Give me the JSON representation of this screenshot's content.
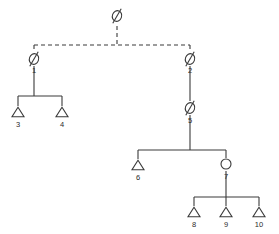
{
  "diagram": {
    "type": "pedigree-chart",
    "title": "",
    "background_color": "#ffffff",
    "line_color": "#3a3a3a",
    "label_color": "#2b2b2b",
    "symbol_legend": {
      "triangle": "unknown-sex individual",
      "circle": "female individual",
      "slashed-circle": "deceased or unspecified individual"
    },
    "nodes": [
      {
        "id": "n0",
        "label": "",
        "symbol": "slashed-circle",
        "x": 117,
        "y": 16,
        "label_x": 117,
        "label_y": 29
      },
      {
        "id": "n1",
        "label": "1",
        "symbol": "slashed-circle",
        "x": 34,
        "y": 59,
        "label_x": 34,
        "label_y": 71
      },
      {
        "id": "n2",
        "label": "2",
        "symbol": "slashed-circle",
        "x": 190,
        "y": 59,
        "label_x": 190,
        "label_y": 71
      },
      {
        "id": "n3",
        "label": "3",
        "symbol": "triangle",
        "x": 18,
        "y": 112,
        "label_x": 18,
        "label_y": 125
      },
      {
        "id": "n4",
        "label": "4",
        "symbol": "triangle",
        "x": 62,
        "y": 112,
        "label_x": 62,
        "label_y": 125
      },
      {
        "id": "n5",
        "label": "5",
        "symbol": "slashed-circle",
        "x": 190,
        "y": 108,
        "label_x": 190,
        "label_y": 121
      },
      {
        "id": "n6",
        "label": "6",
        "symbol": "triangle",
        "x": 138,
        "y": 165,
        "label_x": 138,
        "label_y": 178
      },
      {
        "id": "n7",
        "label": "7",
        "symbol": "circle",
        "x": 226,
        "y": 164,
        "label_x": 226,
        "label_y": 177
      },
      {
        "id": "n8",
        "label": "8",
        "symbol": "triangle",
        "x": 194,
        "y": 212,
        "label_x": 194,
        "label_y": 225
      },
      {
        "id": "n9",
        "label": "9",
        "symbol": "triangle",
        "x": 226,
        "y": 212,
        "label_x": 226,
        "label_y": 225
      },
      {
        "id": "n10",
        "label": "10",
        "symbol": "triangle",
        "x": 259,
        "y": 212,
        "label_x": 259,
        "label_y": 225
      }
    ],
    "links": [
      {
        "id": "l-top-drop",
        "style": "dashed",
        "path": "M 117 26 L 117 45"
      },
      {
        "id": "l-top-bar",
        "style": "dashed",
        "path": "M 34 45 L 190 45"
      },
      {
        "id": "l-bar-to-n1",
        "style": "dashed",
        "path": "M 34 45 L 34 52"
      },
      {
        "id": "l-bar-to-n2",
        "style": "dashed",
        "path": "M 190 45 L 190 52"
      },
      {
        "id": "l-n1-drop",
        "style": "solid",
        "path": "M 34 66 L 34 96"
      },
      {
        "id": "l-n1-sibbar",
        "style": "solid",
        "path": "M 18 96 L 62 96"
      },
      {
        "id": "l-sib-to-n3",
        "style": "solid",
        "path": "M 18 96 L 18 106"
      },
      {
        "id": "l-sib-to-n4",
        "style": "solid",
        "path": "M 62 96 L 62 106"
      },
      {
        "id": "l-n2-to-n5",
        "style": "solid",
        "path": "M 190 66 L 190 101"
      },
      {
        "id": "l-n5-drop",
        "style": "solid",
        "path": "M 190 115 L 190 150"
      },
      {
        "id": "l-n5-sibbar",
        "style": "solid",
        "path": "M 138 150 L 226 150"
      },
      {
        "id": "l-sib-to-n6",
        "style": "solid",
        "path": "M 138 150 L 138 159"
      },
      {
        "id": "l-sib-to-n7",
        "style": "solid",
        "path": "M 226 150 L 226 158"
      },
      {
        "id": "l-n7-drop",
        "style": "solid",
        "path": "M 226 171 L 226 197"
      },
      {
        "id": "l-n7-sibbar",
        "style": "solid",
        "path": "M 194 197 L 259 197"
      },
      {
        "id": "l-sib-to-n8",
        "style": "solid",
        "path": "M 194 197 L 194 206"
      },
      {
        "id": "l-sib-to-n9",
        "style": "solid",
        "path": "M 226 197 L 226 206"
      },
      {
        "id": "l-sib-to-n10",
        "style": "solid",
        "path": "M 259 197 L 259 206"
      }
    ]
  }
}
